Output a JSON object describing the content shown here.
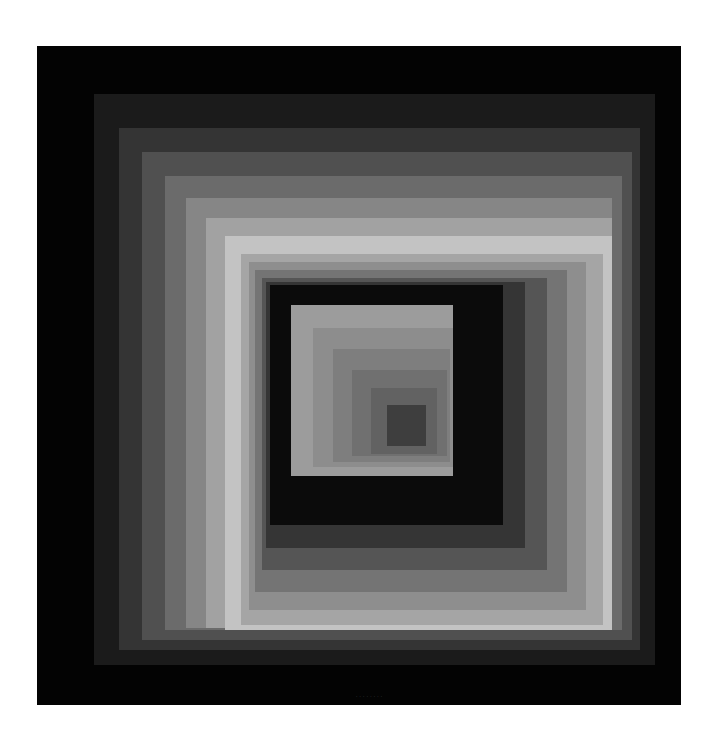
{
  "artwork": {
    "background": "#ffffff",
    "frame": {
      "x": 37,
      "y": 46,
      "w": 644,
      "h": 659,
      "fill": "#030303"
    },
    "outer_bands": [
      {
        "x": 94,
        "y": 94,
        "w": 561,
        "h": 571,
        "fill": "#1b1b1b"
      },
      {
        "x": 119,
        "y": 128,
        "w": 521,
        "h": 522,
        "fill": "#343434"
      },
      {
        "x": 142,
        "y": 152,
        "w": 490,
        "h": 488,
        "fill": "#505050"
      },
      {
        "x": 165,
        "y": 176,
        "w": 457,
        "h": 454,
        "fill": "#6b6b6b"
      },
      {
        "x": 186,
        "y": 198,
        "w": 426,
        "h": 430,
        "fill": "#868686"
      },
      {
        "x": 206,
        "y": 218,
        "w": 406,
        "h": 410,
        "fill": "#a2a2a2"
      },
      {
        "x": 225,
        "y": 236,
        "w": 387,
        "h": 394,
        "fill": "#c3c3c3"
      }
    ],
    "inner_frames": [
      {
        "x": 241,
        "y": 254,
        "w": 362,
        "h": 371,
        "fill": "#a5a5a5"
      },
      {
        "x": 249,
        "y": 262,
        "w": 337,
        "h": 348,
        "fill": "#8e8e8e"
      },
      {
        "x": 255,
        "y": 270,
        "w": 312,
        "h": 322,
        "fill": "#747474"
      },
      {
        "x": 262,
        "y": 278,
        "w": 285,
        "h": 292,
        "fill": "#555555"
      },
      {
        "x": 266,
        "y": 282,
        "w": 259,
        "h": 266,
        "fill": "#353535"
      },
      {
        "x": 270,
        "y": 285,
        "w": 233,
        "h": 240,
        "fill": "#0b0b0b"
      }
    ],
    "inner_squares": [
      {
        "x": 291,
        "y": 305,
        "w": 162,
        "h": 171,
        "fill": "#9c9c9c"
      },
      {
        "x": 313,
        "y": 328,
        "w": 140,
        "h": 139,
        "fill": "#8d8d8d"
      },
      {
        "x": 333,
        "y": 349,
        "w": 117,
        "h": 113,
        "fill": "#7e7e7e"
      },
      {
        "x": 352,
        "y": 370,
        "w": 95,
        "h": 86,
        "fill": "#707070"
      },
      {
        "x": 371,
        "y": 388,
        "w": 66,
        "h": 66,
        "fill": "#626262"
      },
      {
        "x": 387,
        "y": 405,
        "w": 39,
        "h": 41,
        "fill": "#3e3e3e"
      }
    ],
    "signature": {
      "text": "· · · · · · · ·",
      "x": 356,
      "y": 694
    }
  }
}
